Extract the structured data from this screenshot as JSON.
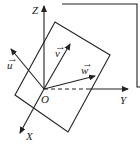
{
  "diagram": {
    "type": "3d-coordinate-system-with-plane",
    "origin_label": "O",
    "axes": [
      {
        "name": "X",
        "label": "X"
      },
      {
        "name": "Y",
        "label": "Y"
      },
      {
        "name": "Z",
        "label": "Z"
      }
    ],
    "vectors": [
      {
        "name": "u",
        "label": "u",
        "arrow_mark": "→"
      },
      {
        "name": "v",
        "label": "v",
        "arrow_mark": "→"
      },
      {
        "name": "w",
        "label": "w",
        "arrow_mark": "→"
      }
    ],
    "plane": "parallelogram through origin",
    "stroke_color": "#222222",
    "background_color": "#ffffff"
  }
}
